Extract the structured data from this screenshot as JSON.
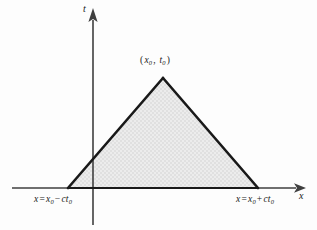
{
  "figure": {
    "kind": "characteristic-triangle",
    "background_color": "#fdfdfd",
    "line_color": "#191919",
    "fill_color": "#e8e8e8",
    "axis_color": "#3a3a3a"
  },
  "axes": {
    "horizontal": {
      "name": "x-axis",
      "label": "x",
      "arrow": "arrow-right-icon",
      "y": 188,
      "x_start": 12,
      "x_end": 303
    },
    "vertical": {
      "name": "t-axis",
      "label": "t",
      "arrow": "arrow-up-icon",
      "x": 93,
      "y_start": 12,
      "y_end": 225
    }
  },
  "triangle": {
    "apex": {
      "x": 163,
      "y": 78,
      "label": "(x₀, t₀)"
    },
    "left_vertex": {
      "x": 68,
      "y": 188,
      "label": "x = x₀ − ct₀"
    },
    "right_vertex": {
      "x": 258,
      "y": 188,
      "label": "x = x₀ + ct₀"
    },
    "stroke_width": 2.6,
    "fill": "#e8e8e8"
  },
  "labels": {
    "axis_t": "t",
    "axis_x": "x",
    "apex_open": "(",
    "apex_var_x": "x",
    "apex_sub_x": "0",
    "apex_comma": ", ",
    "apex_var_t": "t",
    "apex_sub_t": "0",
    "apex_close": ")",
    "left_var": "x",
    "left_eq": "=",
    "left_x0_var": "x",
    "left_x0_sub": "0",
    "left_op": "−",
    "left_c": "c",
    "left_t_var": "t",
    "left_t_sub": "0",
    "right_var": "x",
    "right_eq": "=",
    "right_x0_var": "x",
    "right_x0_sub": "0",
    "right_op": "+",
    "right_c": "c",
    "right_t_var": "t",
    "right_t_sub": "0"
  }
}
